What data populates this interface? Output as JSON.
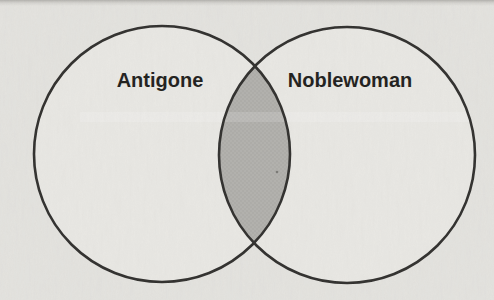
{
  "diagram": {
    "type": "venn",
    "sets": [
      {
        "label": "Antigone"
      },
      {
        "label": "Noblewoman"
      }
    ],
    "overlap": {
      "shaded": true,
      "label": ""
    },
    "colors": {
      "paper_background": "#e4e3df",
      "circle_outline": "#2f2e2c",
      "circle_fill": "#e9e8e4",
      "overlap_fill": "#b2b1ad",
      "label_text": "#1e1d1b"
    }
  }
}
